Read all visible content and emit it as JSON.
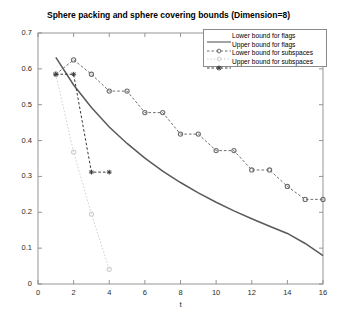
{
  "chart_data": {
    "type": "line",
    "title": "Sphere packing and sphere covering bounds (Dimension=8)",
    "xlabel": "t",
    "ylabel": "",
    "xlim": [
      0,
      16
    ],
    "ylim": [
      0,
      0.7
    ],
    "xticks": [
      0,
      2,
      4,
      6,
      8,
      10,
      12,
      14,
      16
    ],
    "xtick_labels": [
      "0",
      "2",
      "4",
      "6",
      "8",
      "10",
      "12",
      "14",
      "16"
    ],
    "yticks": [
      0,
      0.1,
      0.2,
      0.3,
      0.4,
      0.5,
      0.6,
      0.7
    ],
    "ytick_labels": [
      "0",
      "0.1",
      "0.2",
      "0.3",
      "0.4",
      "0.5",
      "0.6",
      "0.7"
    ],
    "grid": false,
    "legend_position": "upper right",
    "series": [
      {
        "name": "Lower bound for flags",
        "style": "solid",
        "marker": "none",
        "color": "#5a5a5a",
        "points": [
          [
            1,
            0.632
          ],
          [
            2,
            0.555
          ],
          [
            3,
            0.492
          ],
          [
            4,
            0.438
          ],
          [
            5,
            0.392
          ],
          [
            6,
            0.351
          ],
          [
            7,
            0.315
          ],
          [
            8,
            0.283
          ],
          [
            9,
            0.254
          ],
          [
            10,
            0.228
          ],
          [
            11,
            0.204
          ],
          [
            12,
            0.182
          ],
          [
            13,
            0.161
          ],
          [
            14,
            0.141
          ],
          [
            15,
            0.113
          ],
          [
            16,
            0.079
          ]
        ]
      },
      {
        "name": "Upper bound for flags",
        "style": "dashed",
        "marker": "circle",
        "color": "#6e6e6e",
        "points": [
          [
            1,
            0.585
          ],
          [
            2,
            0.625
          ],
          [
            3,
            0.585
          ],
          [
            4,
            0.538
          ],
          [
            5,
            0.538
          ],
          [
            6,
            0.478
          ],
          [
            7,
            0.478
          ],
          [
            8,
            0.418
          ],
          [
            9,
            0.418
          ],
          [
            10,
            0.372
          ],
          [
            11,
            0.372
          ],
          [
            12,
            0.318
          ],
          [
            13,
            0.318
          ],
          [
            14,
            0.272
          ],
          [
            15,
            0.236
          ],
          [
            16,
            0.236
          ]
        ]
      },
      {
        "name": "Lower bound for subspaces",
        "style": "dotted",
        "marker": "circle",
        "color": "#cfcfcf",
        "points": [
          [
            1,
            0.585
          ],
          [
            2,
            0.368
          ],
          [
            3,
            0.195
          ],
          [
            4,
            0.041
          ]
        ]
      },
      {
        "name": "Upper bound for subspaces",
        "style": "dashed",
        "marker": "star",
        "color": "#3a3a3a",
        "points": [
          [
            1,
            0.585
          ],
          [
            2,
            0.585
          ],
          [
            3,
            0.312
          ],
          [
            4,
            0.312
          ]
        ]
      }
    ]
  },
  "legend": {
    "entries": [
      "Lower bound for flags",
      "Upper bound for flags",
      "Lower bound for subspaces",
      "Upper bound for subspaces"
    ]
  },
  "axes": {
    "frame_color": "#8a8a8a"
  }
}
